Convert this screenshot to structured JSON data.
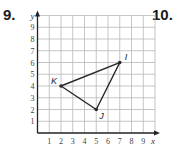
{
  "problems": {
    "left_number": "9.",
    "right_number": "10."
  },
  "chart_data": {
    "type": "scatter",
    "title": "",
    "xlabel": "x",
    "ylabel": "y",
    "xlim": [
      0,
      9
    ],
    "ylim": [
      0,
      9
    ],
    "grid": true,
    "x_ticks": [
      "1",
      "2",
      "3",
      "4",
      "5",
      "6",
      "7",
      "8",
      "9"
    ],
    "y_ticks": [
      "1",
      "2",
      "3",
      "4",
      "5",
      "6",
      "7",
      "8",
      "9"
    ],
    "points": [
      {
        "label": "K",
        "x": 2,
        "y": 4
      },
      {
        "label": "I",
        "x": 7,
        "y": 6
      },
      {
        "label": "J",
        "x": 5,
        "y": 2
      }
    ],
    "polygon": [
      "K",
      "I",
      "J"
    ],
    "colors": {
      "grid": "#b8b8b8",
      "axis": "#222222",
      "shape": "#2a2a2a"
    }
  }
}
